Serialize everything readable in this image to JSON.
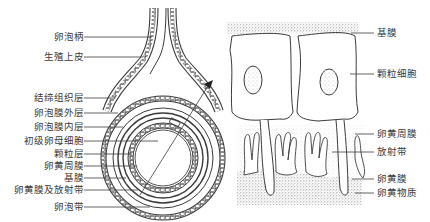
{
  "diagram": {
    "left_panel": {
      "name": "follicle-overview",
      "labels": [
        {
          "id": "stalk",
          "text": "卵泡柄"
        },
        {
          "id": "germinal-epithelium",
          "text": "生殖上皮"
        },
        {
          "id": "connective-tissue-layer",
          "text": "结缔组织层"
        },
        {
          "id": "theca-externa",
          "text": "卵泡膜外层"
        },
        {
          "id": "theca-interna",
          "text": "卵泡膜内层"
        },
        {
          "id": "primary-oocyte",
          "text": "初级卵母细胞"
        },
        {
          "id": "granulosa-layer",
          "text": "颗粒层"
        },
        {
          "id": "perivitelline-membrane",
          "text": "卵黄周膜"
        },
        {
          "id": "basement-membrane",
          "text": "基膜"
        },
        {
          "id": "vitelline-and-radiata",
          "text": "卵黄膜及放射带"
        },
        {
          "id": "stigma",
          "text": "卵泡带"
        }
      ]
    },
    "right_panel": {
      "name": "enlarged-detail",
      "labels": [
        {
          "id": "basement-membrane",
          "text": "基膜"
        },
        {
          "id": "granulosa-cell",
          "text": "颗粒细胞"
        },
        {
          "id": "perivitelline-membrane",
          "text": "卵黄周膜"
        },
        {
          "id": "zona-radiata",
          "text": "放射带"
        },
        {
          "id": "vitelline-membrane",
          "text": "卵黄膜"
        },
        {
          "id": "yolk",
          "text": "卵黄物质"
        }
      ]
    },
    "colors": {
      "line": "#3c3c3c",
      "stipple": "#9a9a9a",
      "background": "#ffffff"
    }
  }
}
